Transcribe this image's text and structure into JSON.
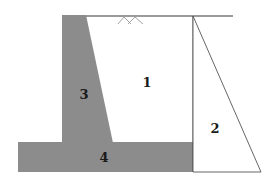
{
  "diagram": {
    "type": "retaining-wall-cross-section",
    "colors": {
      "concrete": "#8c8c8c",
      "line": "#6e6e6e",
      "thin_line": "#555555",
      "label": "#1a1a1a",
      "background": "#ffffff"
    },
    "regions": [
      {
        "id": "1",
        "label": "1",
        "description": "backfill soil region"
      },
      {
        "id": "2",
        "label": "2",
        "description": "triangular earth pressure distribution"
      },
      {
        "id": "3",
        "label": "3",
        "description": "wall stem"
      },
      {
        "id": "4",
        "label": "4",
        "description": "base slab / footing"
      }
    ],
    "ground_symbol": "ground-surface-hatch"
  }
}
